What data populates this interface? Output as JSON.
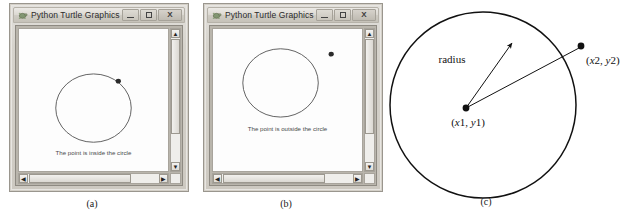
{
  "figure": {
    "captions": {
      "a": "(a)",
      "b": "(b)",
      "c": "(c)"
    }
  },
  "windows": [
    {
      "id": "window-a",
      "title": "Python Turtle Graphics",
      "icon": "turtle-icon",
      "buttons": {
        "minimize": "minimize-button",
        "maximize": "maximize-button",
        "close": "X"
      },
      "canvas": {
        "message": "The point is inside the circle",
        "circle": {
          "cx": 75,
          "cy": 88,
          "r": 38
        },
        "point": {
          "x": 100,
          "y": 58
        },
        "point_state": "inside"
      },
      "scrollbars": {
        "vertical": {
          "up": "▲",
          "down": "▼"
        },
        "horizontal": {
          "left": "◀",
          "right": "▶"
        }
      }
    },
    {
      "id": "window-b",
      "title": "Python Turtle Graphics",
      "icon": "turtle-icon",
      "buttons": {
        "minimize": "minimize-button",
        "maximize": "maximize-button",
        "close": "X"
      },
      "canvas": {
        "message": "The point is outside the circle",
        "circle": {
          "cx": 68,
          "cy": 60,
          "r": 38
        },
        "point": {
          "x": 119,
          "y": 28
        },
        "point_state": "outside"
      },
      "scrollbars": {
        "vertical": {
          "up": "▲",
          "down": "▼"
        },
        "horizontal": {
          "left": "◀",
          "right": "▶"
        }
      }
    }
  ],
  "diagram": {
    "circle": {
      "cx": 95,
      "cy": 105,
      "r": 93
    },
    "center_point": {
      "x": 78,
      "y": 108,
      "label_x": "x1",
      "label_y": "y1",
      "label": "(x1, y1)"
    },
    "outer_point": {
      "x": 193,
      "y": 47,
      "label_x": "x2",
      "label_y": "y2",
      "label": "(x2, y2)"
    },
    "radius_arrow": {
      "from_x": 78,
      "from_y": 108,
      "to_x": 125,
      "to_y": 42,
      "label": "radius"
    },
    "distance_line": {
      "from_x": 78,
      "from_y": 108,
      "to_x": 193,
      "to_y": 47
    },
    "stroke_color": "#111111"
  }
}
